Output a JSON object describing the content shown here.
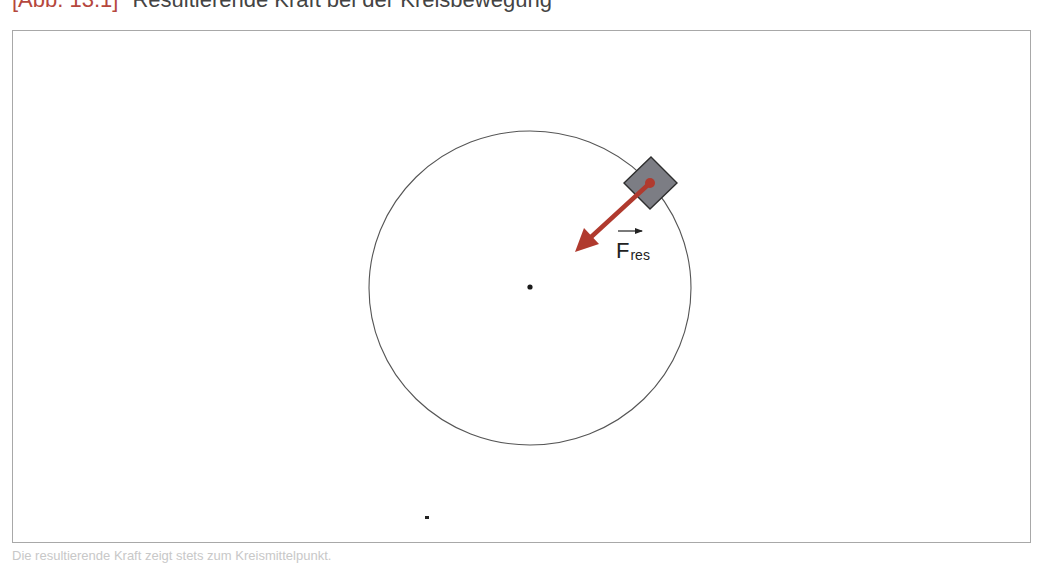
{
  "title": {
    "label": "[Abb. 13.1]",
    "text": "Resultierende Kraft bei der Kreisbewegung"
  },
  "figure": {
    "circle": {
      "cx": 530,
      "cy": 288,
      "rx": 161,
      "ry": 157,
      "stroke": "#555555"
    },
    "center_point": {
      "x": 530,
      "y": 287
    },
    "body": {
      "cx": 650,
      "cy": 183,
      "half_diagonal": 26,
      "fill": "#7a7a80",
      "stroke": "#333333"
    },
    "force_vector": {
      "from": {
        "x": 650,
        "y": 183
      },
      "to": {
        "x": 575,
        "y": 252
      },
      "color": "#b03a2e",
      "symbol": "F",
      "subscript": "res"
    },
    "stray_dot": {
      "x": 427,
      "y": 518
    }
  },
  "caption": {
    "text": "Die resultierende Kraft zeigt stets zum Kreismittelpunkt."
  },
  "colors": {
    "accent": "#b5473d",
    "frame": "#a8a8a8",
    "text": "#444444"
  }
}
